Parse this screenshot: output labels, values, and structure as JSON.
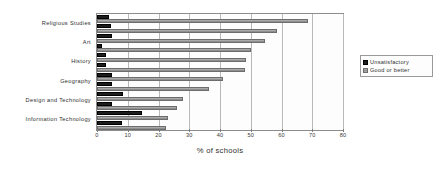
{
  "chart_data": {
    "type": "bar",
    "orientation": "horizontal",
    "title": "",
    "xlabel": "% of schools",
    "ylabel": "",
    "xlim": [
      0,
      80
    ],
    "xticks": [
      0,
      10,
      20,
      30,
      40,
      50,
      60,
      70,
      80
    ],
    "grid": true,
    "legend_position": "right",
    "categories": [
      "Religious Studies",
      "Art",
      "History",
      "Geography",
      "Design and Technology",
      "Information Technology"
    ],
    "series": [
      {
        "name": "Unsatisfactory",
        "color": "#1d1d1d",
        "values": [
          4,
          5,
          2,
          3,
          5,
          8
        ]
      },
      {
        "name": "Good or better",
        "color": "#9b9b9b",
        "values": [
          68.5,
          54.5,
          48.5,
          41,
          28,
          23
        ]
      }
    ],
    "series_secondary": [
      {
        "name": "Unsatisfactory",
        "values": [
          4.5,
          1.5,
          3,
          5,
          5,
          14.5
        ]
      },
      {
        "name": "Good or better",
        "values": [
          58.5,
          50,
          48,
          36.5,
          26,
          22.5
        ]
      }
    ],
    "bar_rows": [
      {
        "category": "Religious Studies",
        "unsatisfactory": 4.0,
        "good_or_better": 68.5
      },
      {
        "category": "Religious Studies",
        "unsatisfactory": 4.5,
        "good_or_better": 58.5
      },
      {
        "category": "Art",
        "unsatisfactory": 5.0,
        "good_or_better": 54.5
      },
      {
        "category": "Art",
        "unsatisfactory": 1.5,
        "good_or_better": 50.0
      },
      {
        "category": "History",
        "unsatisfactory": 3.0,
        "good_or_better": 48.5
      },
      {
        "category": "History",
        "unsatisfactory": 3.0,
        "good_or_better": 48.0
      },
      {
        "category": "Geography",
        "unsatisfactory": 5.0,
        "good_or_better": 41.0
      },
      {
        "category": "Geography",
        "unsatisfactory": 5.0,
        "good_or_better": 36.5
      },
      {
        "category": "Design and Technology",
        "unsatisfactory": 8.5,
        "good_or_better": 28.0
      },
      {
        "category": "Design and Technology",
        "unsatisfactory": 5.0,
        "good_or_better": 26.0
      },
      {
        "category": "Information Technology",
        "unsatisfactory": 14.5,
        "good_or_better": 23.0
      },
      {
        "category": "Information Technology",
        "unsatisfactory": 8.0,
        "good_or_better": 22.5
      }
    ]
  },
  "legend": {
    "items": [
      {
        "label": "Unsatisfactory"
      },
      {
        "label": "Good or better"
      }
    ]
  },
  "axis": {
    "x_title": "% of schools"
  }
}
